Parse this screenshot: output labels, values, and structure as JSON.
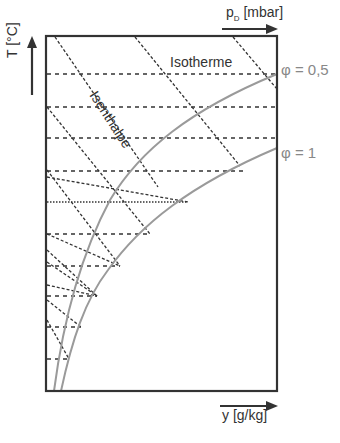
{
  "diagram": {
    "type": "Mollier h,x diagram (schematic)",
    "axes": {
      "vertical": {
        "label": "T [°C]",
        "direction": "up"
      },
      "top": {
        "label_main": "p",
        "label_sub": "D",
        "label_unit": " [mbar]",
        "direction": "right"
      },
      "bottom": {
        "label": "y [g/kg]",
        "direction": "right"
      }
    },
    "labels": {
      "isotherm": "Isotherme",
      "isenthalp": "Isenthalpe",
      "phi_05": "φ = 0,5",
      "phi_1": "φ = 1"
    },
    "colors": {
      "frame": "#333333",
      "dashed": "#333333",
      "curve": "#9a9a9a",
      "curve_label": "#888888"
    }
  }
}
